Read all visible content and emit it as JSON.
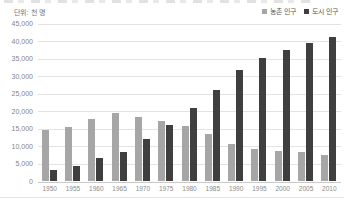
{
  "header": {
    "unit_label": "단위: 천 명"
  },
  "legend": [
    {
      "label": "농촌 인구",
      "color": "#a6a6a6"
    },
    {
      "label": "도시 인구",
      "color": "#3f3f3f"
    }
  ],
  "chart_data": {
    "type": "bar",
    "categories": [
      "1950",
      "1955",
      "1960",
      "1965",
      "1970",
      "1975",
      "1980",
      "1985",
      "1990",
      "1995",
      "2000",
      "2005",
      "2010"
    ],
    "series": [
      {
        "name": "농촌 인구",
        "color": "#a6a6a6",
        "values": [
          14400,
          15500,
          17800,
          19400,
          18300,
          17100,
          15800,
          13400,
          10600,
          9100,
          8700,
          8200,
          7400
        ]
      },
      {
        "name": "도시 인구",
        "color": "#3f3f3f",
        "values": [
          3200,
          4400,
          6500,
          8400,
          12100,
          15900,
          20800,
          26000,
          31500,
          35100,
          37300,
          39200,
          41000
        ]
      }
    ],
    "title": "",
    "xlabel": "",
    "ylabel": "단위: 천 명",
    "ylim": [
      0,
      45000
    ],
    "ytick_step": 5000,
    "grid": true,
    "legend_position": "top-right"
  }
}
